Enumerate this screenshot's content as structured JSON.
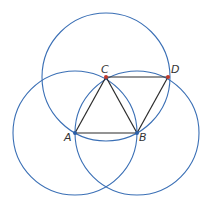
{
  "diagram": {
    "colors": {
      "circle": "#3a6fb5",
      "segment": "#2b2b2b",
      "point_blue": "#2a5fa8",
      "point_red": "#c0392b",
      "label": "#333333"
    },
    "points": [
      {
        "id": "A",
        "label": "A",
        "x": 75,
        "y": 133,
        "color": "point_blue",
        "lx": 64,
        "ly": 141
      },
      {
        "id": "B",
        "label": "B",
        "x": 137,
        "y": 133,
        "color": "point_blue",
        "lx": 139,
        "ly": 141
      },
      {
        "id": "C",
        "label": "C",
        "x": 106,
        "y": 77,
        "color": "point_red",
        "lx": 101,
        "ly": 73
      },
      {
        "id": "D",
        "label": "D",
        "x": 168,
        "y": 77,
        "color": "point_red",
        "lx": 171,
        "ly": 73
      }
    ],
    "circles": [
      {
        "center": "A",
        "cx": 75,
        "cy": 133,
        "r": 62
      },
      {
        "center": "B",
        "cx": 137,
        "cy": 133,
        "r": 62
      },
      {
        "center": "C",
        "cx": 106,
        "cy": 77,
        "r": 64
      }
    ],
    "segments": [
      {
        "from": "A",
        "to": "B"
      },
      {
        "from": "A",
        "to": "C"
      },
      {
        "from": "C",
        "to": "B"
      },
      {
        "from": "C",
        "to": "D"
      },
      {
        "from": "B",
        "to": "D"
      }
    ]
  }
}
